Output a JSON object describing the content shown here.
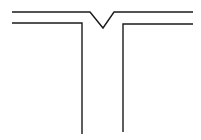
{
  "diagram": {
    "type": "t-junction-groove-weld",
    "stroke_color": "#1a1a1a",
    "background": "#ffffff",
    "labels": []
  }
}
